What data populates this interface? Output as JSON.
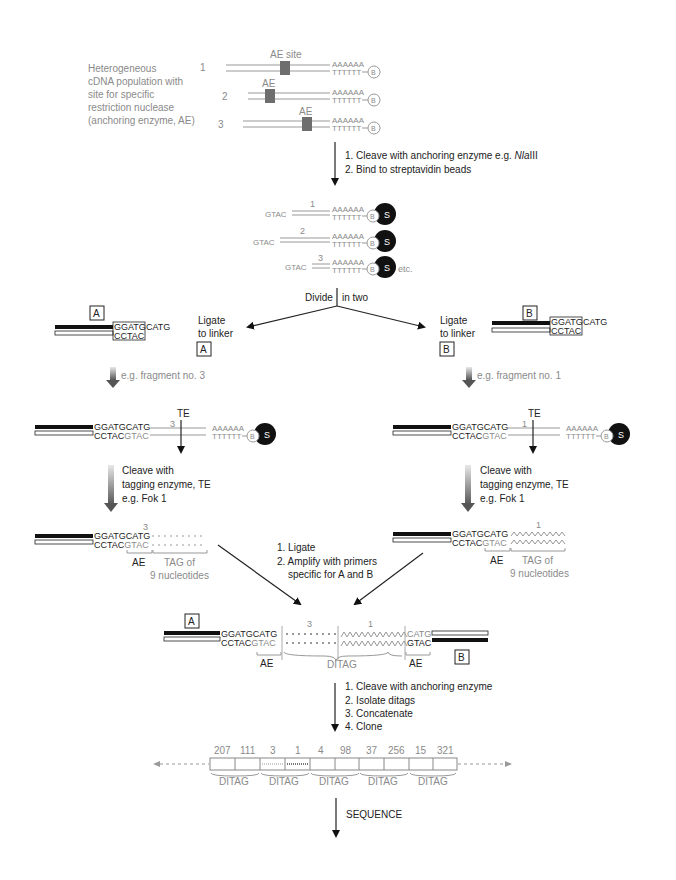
{
  "intro": {
    "description": [
      "Heterogeneous",
      "cDNA population with",
      "site for specific",
      "restriction nuclease",
      "(anchoring enzyme, AE)"
    ],
    "cdna": [
      {
        "num": "1",
        "label": "AE site"
      },
      {
        "num": "2",
        "label": "AE"
      },
      {
        "num": "3",
        "label": "AE"
      }
    ],
    "polyA": "AAAAAA",
    "polyT": "TTTTTT",
    "biotin": "B"
  },
  "step1": {
    "line1_prefix": "1. Cleave with anchoring enzyme e.g. ",
    "line1_enzyme": "Nla",
    "line1_suffix": "III",
    "line2": "2. Bind to streptavidin beads"
  },
  "bound": {
    "overhang": "GTAC",
    "nums": [
      "1",
      "2",
      "3"
    ],
    "bead": "S",
    "etc": "etc."
  },
  "divide": {
    "left": "Divide",
    "right": "in two"
  },
  "linkerA": {
    "box": "A",
    "top_boxed": "GGATG",
    "top_tail": "CATG",
    "bottom_boxed": "CCTAC",
    "ligate": [
      "Ligate",
      "to linker"
    ],
    "ligate_box": "A",
    "example": "e.g. fragment no. 3"
  },
  "linkerB": {
    "box": "B",
    "top_boxed": "GGATG",
    "top_tail": "CATG",
    "bottom_boxed": "CCTAC",
    "ligate": [
      "Ligate",
      "to linker"
    ],
    "ligate_box": "B",
    "example": "e.g. fragment no. 1"
  },
  "ligatedA": {
    "top": "GGATGCATG",
    "bottom_black": "CCTAC",
    "bottom_grey": "GTAC",
    "num": "3",
    "te": "TE"
  },
  "ligatedB": {
    "top": "GGATGCATG",
    "bottom_black": "CCTAC",
    "bottom_grey": "GTAC",
    "num": "1",
    "te": "TE"
  },
  "cleaveTE": [
    "Cleave with",
    "tagging enzyme, TE",
    "e.g. Fok 1"
  ],
  "tagA": {
    "num": "3",
    "ae": "AE",
    "tag": [
      "TAG of",
      "9 nucleotides"
    ]
  },
  "tagB": {
    "num": "1",
    "ae": "AE",
    "tag": [
      "TAG of",
      "9 nucleotides"
    ]
  },
  "step2": [
    "1. Ligate",
    "2. Amplify with primers",
    "specific for A and B"
  ],
  "ditag": {
    "boxA": "A",
    "boxB": "B",
    "left_top": "GGATGCATG",
    "left_bottom_black": "CCTAC",
    "left_bottom_grey": "GTAC",
    "right_top": "CATG",
    "right_bottom": "GTAC",
    "num_left": "3",
    "num_right": "1",
    "ae_left": "AE",
    "ae_right": "AE",
    "ditag_label": "DITAG"
  },
  "step3": [
    "1. Cleave with anchoring enzyme",
    "2. Isolate ditags",
    "3. Concatenate",
    "4. Clone"
  ],
  "concatemer": {
    "tags": [
      "207",
      "111",
      "3",
      "1",
      "4",
      "98",
      "37",
      "256",
      "15",
      "321"
    ],
    "ditag_labels": [
      "DITAG",
      "DITAG",
      "DITAG",
      "DITAG",
      "DITAG"
    ]
  },
  "final_step": "SEQUENCE",
  "colors": {
    "black": "#111111",
    "grey": "#8a8a8a",
    "ae_block": "#6e6e6e"
  }
}
